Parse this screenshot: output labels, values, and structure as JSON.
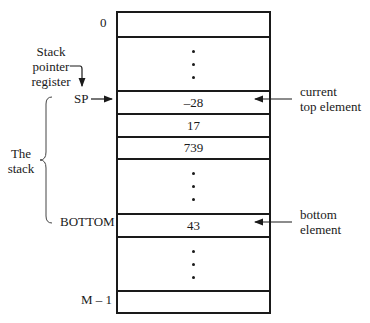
{
  "diagram": {
    "address_labels": {
      "top": "0",
      "bottom": "M – 1"
    },
    "cells": [
      {
        "id": "addr-0",
        "value": "",
        "type": "cell"
      },
      {
        "id": "gap-1",
        "value": "",
        "type": "ellipsis"
      },
      {
        "id": "top",
        "value": "–28",
        "type": "cell"
      },
      {
        "id": "c2",
        "value": "17",
        "type": "cell"
      },
      {
        "id": "c3",
        "value": "739",
        "type": "cell"
      },
      {
        "id": "gap-2",
        "value": "",
        "type": "ellipsis"
      },
      {
        "id": "bottom",
        "value": "43",
        "type": "cell"
      },
      {
        "id": "gap-3",
        "value": "",
        "type": "ellipsis"
      },
      {
        "id": "addr-last",
        "value": "",
        "type": "cell"
      }
    ],
    "pointer_register_label": [
      "Stack",
      "pointer",
      "register"
    ],
    "sp_label": "SP",
    "bottom_label": "BOTTOM",
    "stack_brace_label": [
      "The",
      "stack"
    ],
    "current_top_label": [
      "current",
      "top element"
    ],
    "bottom_element_label": [
      "bottom",
      "element"
    ]
  }
}
